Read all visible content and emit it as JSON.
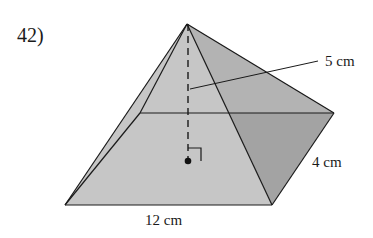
{
  "problem": {
    "number": "42)"
  },
  "figure": {
    "type": "square-based right pyramid",
    "labels": {
      "height": "5 cm",
      "base_length": "12 cm",
      "base_depth": "4 cm"
    },
    "colors": {
      "front_face": "#c4c4c4",
      "left_face": "#b8b8b8",
      "right_face": "#a3a3a3",
      "back_face": "#b0b0b0",
      "edge": "#1a1a1a"
    }
  }
}
